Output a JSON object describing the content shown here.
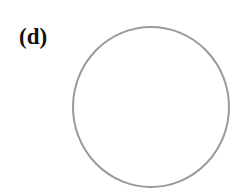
{
  "panel": {
    "label": "(d)"
  },
  "shape": {
    "type": "circle",
    "cx": 151,
    "cy": 107,
    "rx": 78,
    "ry": 80,
    "stroke": "#9a9a9a",
    "stroke_width": 2,
    "fill": "#ffffff"
  }
}
